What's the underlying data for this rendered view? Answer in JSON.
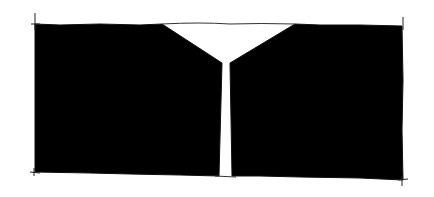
{
  "diagram": {
    "colors": {
      "fill": "#000000",
      "background": "#ffffff",
      "stroke": "#222222"
    },
    "outline": {
      "left": 35,
      "right": 403,
      "top_left": 25,
      "top_right": 26,
      "bottom_left": 172,
      "bottom_right": 180
    },
    "notch": {
      "top_left_x": 162,
      "top_right_x": 295,
      "top_y": 24,
      "apex_left_x": 222,
      "apex_right_x": 230,
      "apex_y": 63
    },
    "slit": {
      "left_x_top": 222,
      "right_x_top": 229,
      "left_x_bottom": 219,
      "right_x_bottom": 232,
      "bottom_y": 176
    }
  }
}
